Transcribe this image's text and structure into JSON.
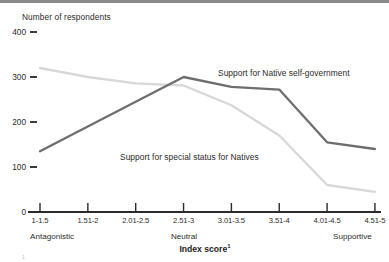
{
  "figure": {
    "y_axis_title": "Number of respondents",
    "x_axis_title": "Index score",
    "x_axis_title_superscript": "1",
    "footnote_marker": "1",
    "footnote_text": "",
    "top_rule_color": "#8a8a8a"
  },
  "chart_data": {
    "type": "line",
    "title": "",
    "xlabel": "Index score",
    "ylabel": "Number of respondents",
    "ylim": [
      0,
      400
    ],
    "yticks": [
      0,
      100,
      200,
      300,
      400
    ],
    "ytick_labels": [
      "0",
      "100",
      "200",
      "300",
      "400"
    ],
    "grid": false,
    "legend": "inline-annotations",
    "categories": [
      "1-1.5",
      "1.51-2",
      "2.01-2.5",
      "2.51-3",
      "3.01-3.5",
      "3.51-4",
      "4.01-4.5",
      "4.51-5"
    ],
    "x_anchor_labels": {
      "left": "Antagonistic",
      "center": "Neutral",
      "right": "Supportive"
    },
    "series": [
      {
        "name": "Support for Native self-government",
        "color": "#6e6e6e",
        "values": [
          135,
          190,
          245,
          300,
          278,
          272,
          155,
          140
        ]
      },
      {
        "name": "Support for special status for Natives",
        "color": "#d8d8d8",
        "values": [
          320,
          300,
          286,
          281,
          237,
          170,
          60,
          45
        ]
      }
    ],
    "annotations": [
      {
        "text": "Support for Native self-government",
        "series": "Support for Native self-government"
      },
      {
        "text": "Support for special status for Natives",
        "series": "Support for special status for Natives"
      }
    ]
  }
}
